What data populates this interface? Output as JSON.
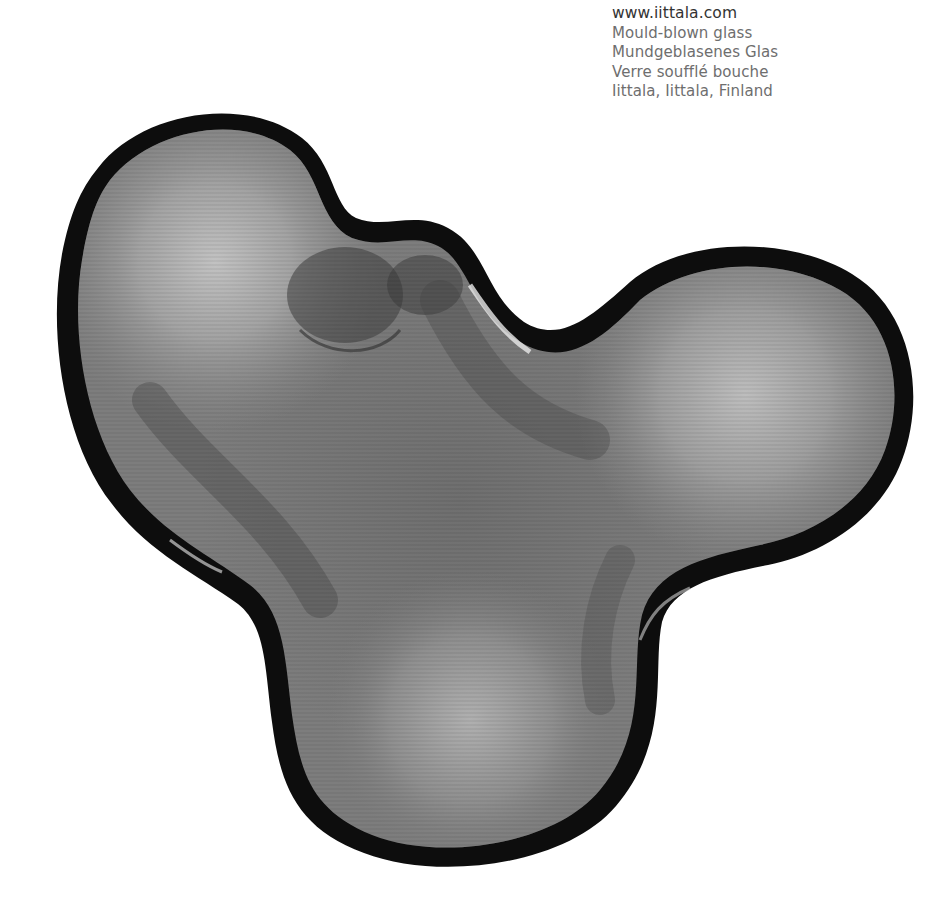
{
  "product_info": {
    "website": "www.iittala.com",
    "lines": [
      "Mould-blown glass",
      "Mundgeblasenes Glas",
      "Verre soufflé bouche",
      "Iittala, Iittala, Finland"
    ]
  },
  "image": {
    "subject": "glass-bowl",
    "description": "Organic, three-lobed mould-blown grey glass bowl viewed from above, with a dark rim",
    "colors": {
      "background": "#ffffff",
      "glass_body": "#7a7a7a",
      "glass_highlight": "#b5b5b5",
      "glass_shadow": "#4a4a4a",
      "rim": "#0d0d0d"
    }
  }
}
